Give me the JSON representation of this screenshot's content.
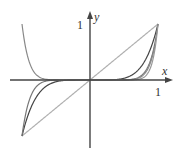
{
  "chart_data": {
    "type": "line",
    "title": "",
    "xlabel": "x",
    "ylabel": "y",
    "tick_labels": {
      "x": [
        "1"
      ],
      "y": [
        "1"
      ]
    },
    "xlim": [
      -1.45,
      1.1
    ],
    "ylim": [
      -1.2,
      1.2
    ],
    "grid": false,
    "legend": null,
    "series": [
      {
        "name": "y = x",
        "exponent": 1,
        "color": "#b0b0b0",
        "domain": [
          -1,
          1
        ]
      },
      {
        "name": "y = x^5",
        "exponent": 5,
        "color": "#444444",
        "domain": [
          -1,
          1
        ]
      },
      {
        "name": "y = x^9",
        "exponent": 9,
        "color": "#777777",
        "domain": [
          -1,
          1
        ]
      },
      {
        "name": "y = x^13",
        "exponent": 13,
        "color": "#999999",
        "domain": [
          0,
          1
        ]
      },
      {
        "name": "y = x^10",
        "exponent": 10,
        "color": "#888888",
        "domain": [
          -1,
          0.95
        ]
      }
    ]
  },
  "labels": {
    "x_axis": "x",
    "y_axis": "y",
    "x_one": "1",
    "y_one": "1"
  }
}
